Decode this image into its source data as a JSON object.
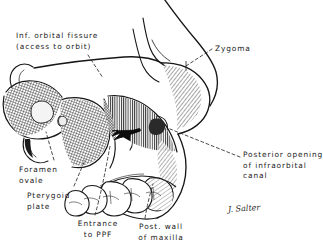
{
  "figure": {
    "kind": "anatomical-line-drawing",
    "background_color": "#ffffff",
    "ink_color": "#161616",
    "leader_line_style": "dashed"
  },
  "labels": [
    {
      "id": "inf-orbital-fissure",
      "line1": "Inf. orbital fissure",
      "line2": "(access to orbit)",
      "align": "left",
      "x": 16,
      "y": 31
    },
    {
      "id": "zygoma",
      "line1": "Zygoma",
      "align": "left",
      "x": 215,
      "y": 44
    },
    {
      "id": "posterior-opening-infraorbital-canal",
      "line1": "Posterior opening",
      "line2": "of infraorbital",
      "line3": "canal",
      "align": "left",
      "x": 243,
      "y": 150
    },
    {
      "id": "foramen-ovale",
      "line1": "Foramen",
      "line2": "ovale",
      "align": "left",
      "x": 19,
      "y": 165
    },
    {
      "id": "pterygoid-plate",
      "line1": "Pterygoid",
      "line2": "plate",
      "align": "left",
      "x": 27,
      "y": 191
    },
    {
      "id": "entrance-to-ppf",
      "line1": "Entrance",
      "line2": "to PPF",
      "align": "center",
      "x": 68,
      "y": 219
    },
    {
      "id": "post-wall-of-maxilla",
      "line1": "Post. wall",
      "line2": "of maxilla",
      "align": "center",
      "x": 130,
      "y": 222
    }
  ],
  "signature": {
    "text": "J. Salter",
    "x": 228,
    "y": 210
  }
}
